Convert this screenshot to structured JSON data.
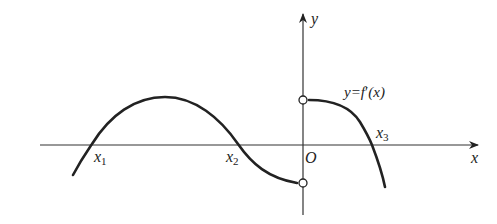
{
  "diagram": {
    "type": "function-graph",
    "axes": {
      "x_label": "x",
      "y_label": "y",
      "origin_label": "O"
    },
    "curve_label": {
      "prefix": "y=",
      "func": "f",
      "prime": "′",
      "arg": "(x)"
    },
    "roots": [
      {
        "base": "x",
        "sub": "1"
      },
      {
        "base": "x",
        "sub": "2"
      },
      {
        "base": "x",
        "sub": "3"
      }
    ],
    "open_points": [
      "upper y-intercept (excluded)",
      "lower y-intercept (excluded)"
    ],
    "colors": {
      "stroke": "#222222",
      "background": "#ffffff"
    }
  }
}
